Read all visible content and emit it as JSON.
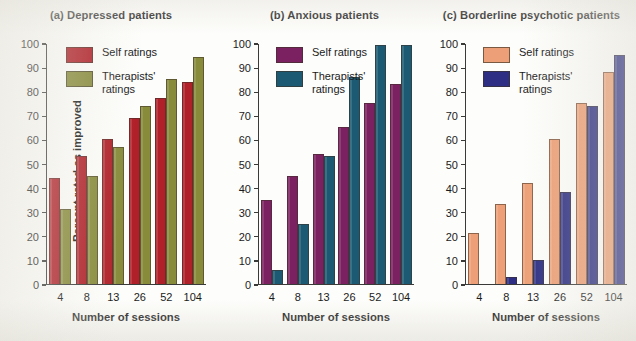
{
  "figure": {
    "axis_y_title": "Percent rated as improved",
    "axis_x_title": "Number of sessions",
    "legend_self": "Self ratings",
    "legend_therapist": "Therapists'\nratings"
  },
  "chart_data": [
    {
      "type": "bar",
      "title": "(a) Depressed patients",
      "xlabel": "Number of sessions",
      "ylabel": "Percent rated as improved",
      "categories": [
        "4",
        "8",
        "13",
        "26",
        "52",
        "104"
      ],
      "ylim": [
        0,
        100
      ],
      "yticks": [
        0,
        10,
        20,
        30,
        40,
        50,
        60,
        70,
        80,
        90,
        100
      ],
      "grid": false,
      "legend_position": "top-left",
      "series": [
        {
          "name": "Self ratings",
          "color": "#b02029",
          "values": [
            44,
            53,
            60,
            69,
            77,
            84
          ]
        },
        {
          "name": "Therapists' ratings",
          "color": "#878b3a",
          "values": [
            31,
            45,
            57,
            74,
            85,
            94
          ]
        }
      ]
    },
    {
      "type": "bar",
      "title": "(b) Anxious patients",
      "xlabel": "Number of sessions",
      "ylabel": "Percent rated as improved",
      "categories": [
        "4",
        "8",
        "13",
        "26",
        "52",
        "104"
      ],
      "ylim": [
        0,
        100
      ],
      "yticks": [
        0,
        10,
        20,
        30,
        40,
        50,
        60,
        70,
        80,
        90,
        100
      ],
      "grid": false,
      "legend_position": "top-left",
      "series": [
        {
          "name": "Self ratings",
          "color": "#7b2060",
          "values": [
            35,
            45,
            54,
            65,
            75,
            83
          ]
        },
        {
          "name": "Therapists' ratings",
          "color": "#1b5a72",
          "values": [
            6,
            25,
            53,
            86,
            99,
            99
          ]
        }
      ]
    },
    {
      "type": "bar",
      "title": "(c) Borderline psychotic patients",
      "xlabel": "Number of sessions",
      "ylabel": "Percent rated as improved",
      "categories": [
        "4",
        "8",
        "13",
        "26",
        "52",
        "104"
      ],
      "ylim": [
        0,
        100
      ],
      "yticks": [
        0,
        10,
        20,
        30,
        40,
        50,
        60,
        70,
        80,
        90,
        100
      ],
      "grid": false,
      "legend_position": "top-left",
      "series": [
        {
          "name": "Self ratings",
          "color": "#eda077",
          "values": [
            21,
            33,
            42,
            60,
            75,
            88
          ]
        },
        {
          "name": "Therapists' ratings",
          "color": "#2e2f84",
          "values": [
            0,
            3,
            10,
            38,
            74,
            95
          ]
        }
      ]
    }
  ]
}
